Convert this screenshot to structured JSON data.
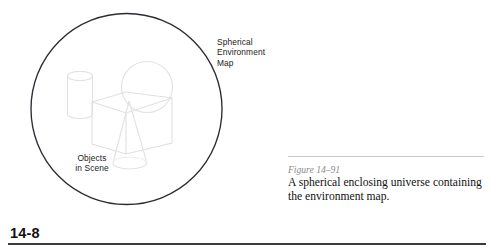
{
  "figure": {
    "callouts": {
      "environment_map": "Spherical\nEnvironment\nMap",
      "objects_in_scene": "Objects\nin Scene"
    },
    "shapes": [
      {
        "name": "spherical-environment-map-circle",
        "type": "circle",
        "cx": 126.5,
        "cy": 109,
        "r": 95.5,
        "stroke": "#2b2b33"
      },
      {
        "name": "cylinder-object",
        "type": "cylinder",
        "stroke": "#e3e3e3"
      },
      {
        "name": "sphere-object",
        "type": "sphere",
        "stroke": "#e3e3e3"
      },
      {
        "name": "cube-object",
        "type": "cube",
        "stroke": "#e0e0e0"
      },
      {
        "name": "cone-object",
        "type": "cone",
        "stroke": "#e3e3e3"
      }
    ]
  },
  "caption": {
    "label": "Figure 14–91",
    "text": "A spherical enclosing universe containing the environment map."
  },
  "footer": {
    "page_number": "14-8"
  },
  "colors": {
    "circle_stroke": "#2b2b33",
    "object_stroke": "#e2e2e2",
    "caption_label": "#8c8c8c",
    "caption_rule": "#c9c9c9",
    "footer_rule": "#3a3a46",
    "text": "#111111"
  }
}
